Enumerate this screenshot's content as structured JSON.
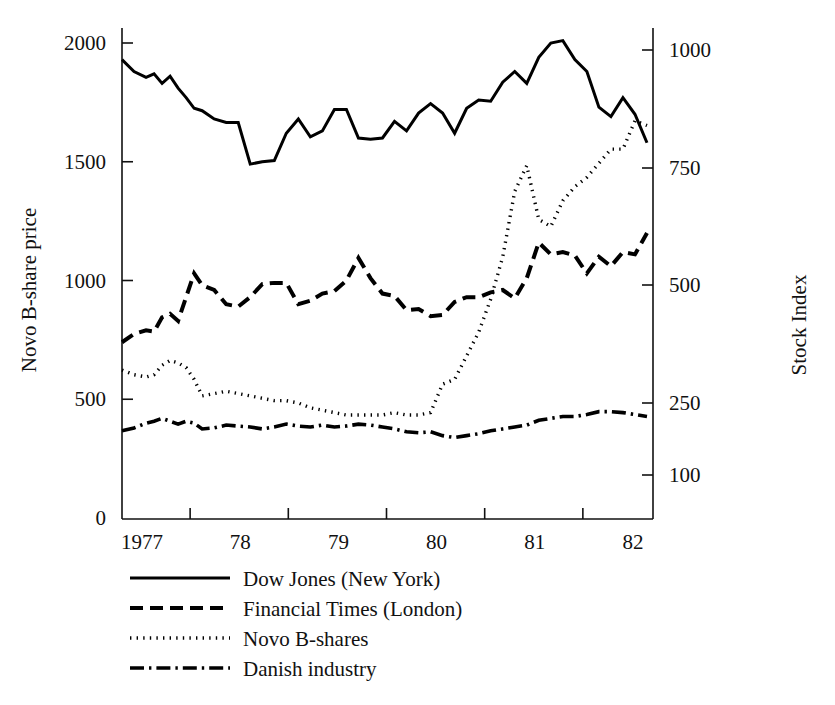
{
  "chart_data": {
    "type": "line",
    "title": "",
    "ylabel": "Novo B-share price",
    "ylabel_right": "Stock Index",
    "xlabel": "",
    "grid": false,
    "legend_position": "below-left",
    "x_tick_labels": [
      "1977",
      "78",
      "79",
      "80",
      "81",
      "82"
    ],
    "y_left_ticks": [
      "0",
      "500",
      "1000",
      "1500",
      "2000"
    ],
    "y_right_ticks": [
      "100",
      "250",
      "500",
      "750",
      "1000"
    ],
    "ylim_left": [
      0,
      2150
    ],
    "ylim_right_note": "non-linear spacing: 100 at same height as ~180 left units",
    "xlim": [
      "1976.8",
      "1982.1"
    ],
    "series": [
      {
        "name": "Dow Jones (New York)",
        "style": "solid",
        "axis": "left",
        "x": [
          1976.8,
          1976.92,
          1977.04,
          1977.12,
          1977.2,
          1977.28,
          1977.36,
          1977.44,
          1977.52,
          1977.6,
          1977.72,
          1977.84,
          1977.96,
          1978.08,
          1978.2,
          1978.32,
          1978.44,
          1978.56,
          1978.68,
          1978.8,
          1978.92,
          1979.04,
          1979.16,
          1979.28,
          1979.4,
          1979.52,
          1979.64,
          1979.76,
          1979.88,
          1980.0,
          1980.12,
          1980.24,
          1980.36,
          1980.48,
          1980.6,
          1980.72,
          1980.84,
          1980.96,
          1981.08,
          1981.2,
          1981.32,
          1981.44,
          1981.56,
          1981.68,
          1981.8,
          1981.92,
          1982.04
        ],
        "values": [
          1930,
          1880,
          1855,
          1870,
          1830,
          1860,
          1810,
          1770,
          1725,
          1715,
          1680,
          1665,
          1665,
          1490,
          1500,
          1505,
          1620,
          1680,
          1605,
          1630,
          1720,
          1720,
          1600,
          1595,
          1600,
          1670,
          1630,
          1705,
          1745,
          1705,
          1620,
          1725,
          1760,
          1755,
          1835,
          1880,
          1830,
          1940,
          2000,
          2010,
          1930,
          1880,
          1730,
          1690,
          1770,
          1700,
          1580
        ]
      },
      {
        "name": "Financial Times (London)",
        "style": "dashed",
        "axis": "left",
        "x": [
          1976.8,
          1976.92,
          1977.04,
          1977.12,
          1977.2,
          1977.28,
          1977.36,
          1977.44,
          1977.52,
          1977.6,
          1977.72,
          1977.84,
          1977.96,
          1978.08,
          1978.2,
          1978.32,
          1978.44,
          1978.56,
          1978.68,
          1978.8,
          1978.92,
          1979.04,
          1979.16,
          1979.28,
          1979.4,
          1979.52,
          1979.64,
          1979.76,
          1979.88,
          1980.0,
          1980.12,
          1980.24,
          1980.36,
          1980.48,
          1980.6,
          1980.72,
          1980.84,
          1980.96,
          1981.08,
          1981.2,
          1981.32,
          1981.44,
          1981.56,
          1981.68,
          1981.8,
          1981.92,
          1982.04
        ],
        "values": [
          740,
          775,
          790,
          785,
          845,
          860,
          830,
          930,
          1030,
          980,
          960,
          900,
          890,
          930,
          985,
          990,
          990,
          900,
          915,
          945,
          955,
          1000,
          1095,
          1010,
          945,
          935,
          875,
          880,
          850,
          855,
          910,
          930,
          930,
          950,
          960,
          925,
          1010,
          1160,
          1110,
          1120,
          1105,
          1030,
          1100,
          1060,
          1120,
          1110,
          1200
        ]
      },
      {
        "name": "Novo B-shares",
        "style": "dotted",
        "axis": "right",
        "x": [
          1976.8,
          1976.92,
          1977.04,
          1977.12,
          1977.2,
          1977.28,
          1977.36,
          1977.44,
          1977.52,
          1977.6,
          1977.72,
          1977.84,
          1977.96,
          1978.08,
          1978.2,
          1978.32,
          1978.44,
          1978.56,
          1978.68,
          1978.8,
          1978.92,
          1979.04,
          1979.16,
          1979.28,
          1979.4,
          1979.52,
          1979.64,
          1979.76,
          1979.88,
          1980.0,
          1980.12,
          1980.24,
          1980.36,
          1980.48,
          1980.6,
          1980.72,
          1980.84,
          1980.96,
          1981.08,
          1981.2,
          1981.32,
          1981.44,
          1981.56,
          1981.68,
          1981.8,
          1981.92,
          1982.04
        ],
        "values": [
          320,
          310,
          305,
          310,
          330,
          340,
          335,
          325,
          300,
          265,
          270,
          275,
          270,
          265,
          260,
          255,
          255,
          250,
          240,
          235,
          230,
          225,
          225,
          225,
          225,
          230,
          225,
          225,
          230,
          290,
          300,
          350,
          400,
          470,
          560,
          700,
          755,
          640,
          625,
          680,
          710,
          730,
          760,
          790,
          790,
          850,
          840
        ]
      },
      {
        "name": "Danish industry",
        "style": "dashdot",
        "axis": "right",
        "x": [
          1976.8,
          1976.92,
          1977.04,
          1977.12,
          1977.2,
          1977.28,
          1977.36,
          1977.44,
          1977.52,
          1977.6,
          1977.72,
          1977.84,
          1977.96,
          1978.08,
          1978.2,
          1978.32,
          1978.44,
          1978.56,
          1978.68,
          1978.8,
          1978.92,
          1979.04,
          1979.16,
          1979.28,
          1979.4,
          1979.52,
          1979.64,
          1979.76,
          1979.88,
          1980.0,
          1980.12,
          1980.24,
          1980.36,
          1980.48,
          1980.6,
          1980.72,
          1980.84,
          1980.96,
          1981.08,
          1981.2,
          1981.32,
          1981.44,
          1981.56,
          1981.68,
          1981.8,
          1981.92,
          1982.04
        ],
        "values": [
          192,
          198,
          208,
          212,
          218,
          212,
          206,
          212,
          208,
          196,
          198,
          204,
          202,
          200,
          196,
          200,
          206,
          202,
          200,
          204,
          200,
          202,
          206,
          204,
          200,
          196,
          190,
          188,
          190,
          182,
          178,
          182,
          186,
          192,
          196,
          200,
          204,
          214,
          218,
          222,
          222,
          226,
          232,
          232,
          230,
          226,
          222
        ]
      }
    ]
  },
  "legend": {
    "items": [
      {
        "label": "Dow Jones (New York)",
        "style": "solid"
      },
      {
        "label": "Financial Times (London)",
        "style": "dashed"
      },
      {
        "label": "Novo B-shares",
        "style": "dotted"
      },
      {
        "label": "Danish industry",
        "style": "dashdot"
      }
    ]
  }
}
